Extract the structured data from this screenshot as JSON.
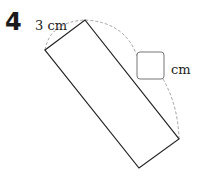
{
  "problem": {
    "number": "4",
    "side_label": "3 cm",
    "unknown_unit": "cm"
  },
  "colors": {
    "stroke": "#222222",
    "dashed": "#999999",
    "answer_box": "#777777"
  }
}
